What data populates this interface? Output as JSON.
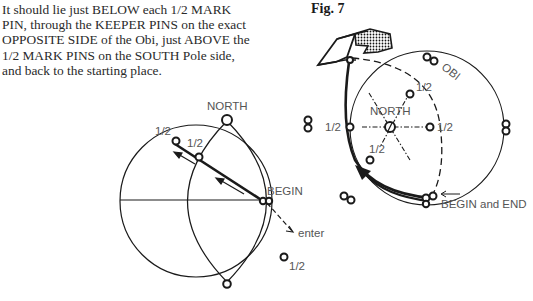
{
  "instructions": {
    "lines": [
      "It should lie just BELOW each 1/2 MARK",
      "PIN, through the KEEPER PINS on the exact",
      "OPPOSITE SIDE of the Obi, just ABOVE the",
      "1/2 MARK PINS on the SOUTH Pole side,",
      "and back to the starting place."
    ]
  },
  "figure": {
    "title": "Fig. 7"
  },
  "left_globe": {
    "north_label": "NORTH",
    "half_mark_outer": "1/2",
    "half_mark_inner": "1/2",
    "begin_label": "BEGIN",
    "enter_label": "enter",
    "half_mark_lower": "1/2"
  },
  "right_globe": {
    "obi_label": "OBI",
    "north_label": "NORTH",
    "half_mark_top": "1/2",
    "half_mark_left": "1/2",
    "half_mark_right": "1/2",
    "half_mark_lower": "1/2",
    "begin_end_label": "BEGIN and END"
  },
  "colors": {
    "line": "#1a1a1a",
    "label": "#555555",
    "text": "#2a2a2a"
  }
}
